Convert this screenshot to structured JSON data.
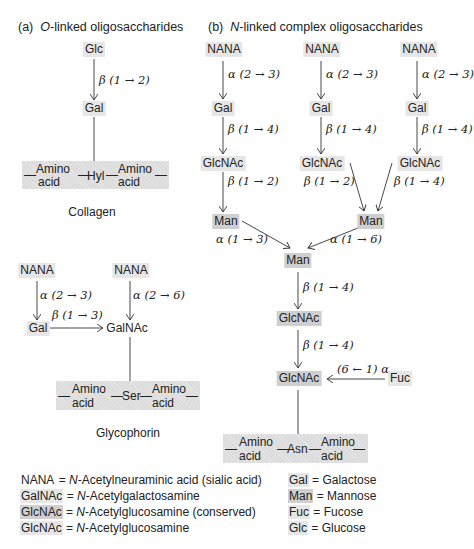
{
  "panel_a": {
    "prefix": "(a)",
    "title_italic": "O",
    "title_rest": "-linked oligosaccharides",
    "collagen": {
      "nodes": {
        "glc": "Glc",
        "gal": "Gal"
      },
      "linkages": {
        "glc_gal": "β (1 → 2)"
      },
      "chain": {
        "left_top": "Amino",
        "left_bottom": "acid",
        "center": "Hyl",
        "right_top": "Amino",
        "right_bottom": "acid"
      },
      "caption": "Collagen"
    },
    "glycophorin": {
      "nodes": {
        "nana_left": "NANA",
        "nana_right": "NANA",
        "gal": "Gal",
        "galnac": "GalNAc"
      },
      "linkages": {
        "nana_gal": "α (2 → 3)",
        "nana_galnac": "α (2 → 6)",
        "gal_galnac": "β (1 → 3)"
      },
      "chain": {
        "left_top": "Amino",
        "left_bottom": "acid",
        "center": "Ser",
        "right_top": "Amino",
        "right_bottom": "acid"
      },
      "caption": "Glycophorin"
    }
  },
  "panel_b": {
    "prefix": "(b)",
    "title_italic": "N",
    "title_rest": "-linked complex oligosaccharides",
    "branches": [
      {
        "nana": "NANA",
        "l1": "α (2 → 3)",
        "gal": "Gal",
        "l2": "β (1 → 4)",
        "glcnac": "GlcNAc",
        "l3": "β (1 → 2)"
      },
      {
        "nana": "NANA",
        "l1": "α (2 → 3)",
        "gal": "Gal",
        "l2": "β (1 → 4)",
        "glcnac": "GlcNAc",
        "l3": "β (1 → 2)"
      },
      {
        "nana": "NANA",
        "l1": "α (2 → 3)",
        "gal": "Gal",
        "l2": "β (1 → 4)",
        "glcnac": "GlcNAc",
        "l3": "β (1 → 4)"
      }
    ],
    "man_left": "Man",
    "man_right": "Man",
    "man_left_link": "α (1 → 3)",
    "man_right_link": "α (1 → 6)",
    "man_core": "Man",
    "core_link_1": "β (1 → 4)",
    "glcnac_core_1": "GlcNAc",
    "core_link_2": "β (1 → 4)",
    "glcnac_core_2": "GlcNAc",
    "fuc": "Fuc",
    "fuc_link": "(6 ← 1) α",
    "chain": {
      "left_top": "Amino",
      "left_bottom": "acid",
      "center": "Asn",
      "right_top": "Amino",
      "right_bottom": "acid"
    }
  },
  "legend": {
    "left": [
      {
        "abbr": "NANA",
        "eq": " = ",
        "italic": "N",
        "rest": "-Acetylneuraminic acid (sialic acid)",
        "style": "plain"
      },
      {
        "abbr": "GalNAc",
        "eq": " = ",
        "italic": "N",
        "rest": "-Acetylgalactosamine",
        "style": "light"
      },
      {
        "abbr": "GlcNAc",
        "eq": " = ",
        "italic": "N",
        "rest": "-Acetylglucosamine (conserved)",
        "style": "dark"
      },
      {
        "abbr": "GlcNAc",
        "eq": " = ",
        "italic": "N",
        "rest": "-Acetylglucosamine",
        "style": "light"
      }
    ],
    "right": [
      {
        "abbr": "Gal",
        "eq": " = ",
        "rest": "Galactose",
        "style": "light"
      },
      {
        "abbr": "Man",
        "eq": " = ",
        "rest": "Mannose",
        "style": "dark"
      },
      {
        "abbr": "Fuc",
        "eq": " = ",
        "rest": "Fucose",
        "style": "light"
      },
      {
        "abbr": "Glc",
        "eq": " = ",
        "rest": "Glucose",
        "style": "light"
      }
    ]
  },
  "colors": {
    "node_light": "#e6e6e6",
    "node_conserved": "#cfcfcf",
    "chain_band": "#dcdcdc",
    "line": "#333333"
  }
}
